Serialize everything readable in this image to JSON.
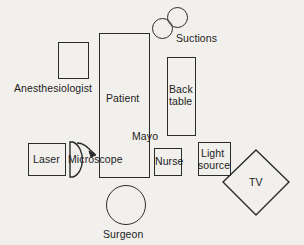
{
  "diagram": {
    "background_color": "#f2f0ec",
    "stroke_color": "#2b2b2b",
    "text_color": "#1c1c1c",
    "nodes": {
      "anesthesiologist": {
        "label": "Anesthesiologist",
        "shape": "rectangle",
        "label_position": "below"
      },
      "patient": {
        "label": "Patient",
        "shape": "rectangle",
        "label_position": "inside"
      },
      "suctions": {
        "label": "Suctions",
        "shape": "circle-pair",
        "count": 2,
        "label_position": "right"
      },
      "back_table": {
        "label": "Back table",
        "label_line_1": "Back",
        "label_line_2": "table",
        "shape": "rectangle",
        "label_position": "inside"
      },
      "mayo": {
        "label": "Mayo",
        "shape": "label-only",
        "label_position": "standalone"
      },
      "laser": {
        "label": "Laser",
        "shape": "rectangle",
        "label_position": "inside"
      },
      "microscope": {
        "label": "Microscope",
        "shape": "d-shape-with-arrow",
        "label_position": "overlay"
      },
      "nurse": {
        "label": "Nurse",
        "shape": "rectangle",
        "label_position": "inside"
      },
      "light_source": {
        "label": "Light source",
        "label_line_1": "Light",
        "label_line_2": "source",
        "shape": "rectangle",
        "label_position": "inside"
      },
      "tv": {
        "label": "TV",
        "shape": "diamond",
        "label_position": "inside"
      },
      "surgeon": {
        "label": "Surgeon",
        "shape": "circle",
        "label_position": "below"
      }
    }
  }
}
